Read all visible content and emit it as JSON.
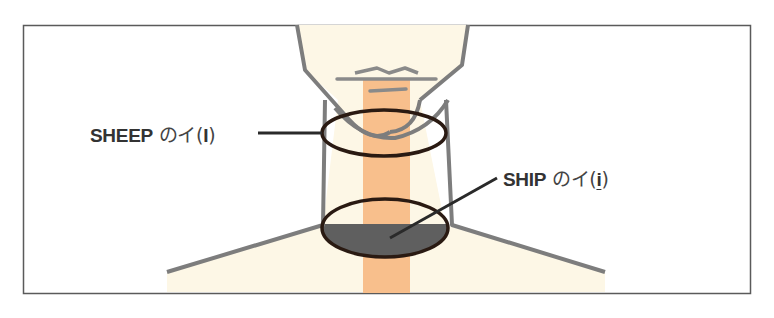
{
  "diagram": {
    "title": "",
    "labels": {
      "sheep": {
        "word": "SHEEP",
        "jp": "のイ",
        "open": "(",
        "symbol": "I",
        "close": ")"
      },
      "ship": {
        "word": "SHIP",
        "jp": "のイ",
        "open": "(",
        "symbol": "i",
        "close": ")"
      }
    },
    "colors": {
      "frame": "#5a5a5a",
      "skin": "#fdf7e6",
      "outline": "#7d7d7d",
      "throat_stripe": "#f8bf8c",
      "ellipse": "#2a1a12",
      "shaded": "#5f5f5f",
      "text": "#333333"
    },
    "parts": [
      "chin",
      "neck",
      "shoulders",
      "upper-ellipse",
      "lower-ellipse",
      "throat-stripe"
    ]
  }
}
